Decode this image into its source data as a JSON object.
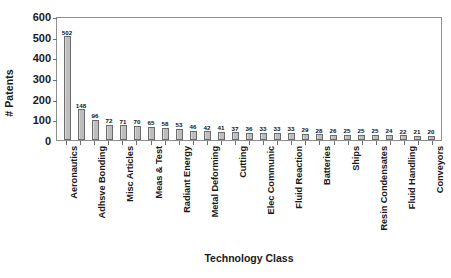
{
  "chart_data": {
    "type": "bar",
    "title": "",
    "xlabel": "Technology Class",
    "ylabel": "# Patents",
    "ylim": [
      0,
      600
    ],
    "yticks": [
      0,
      100,
      200,
      300,
      400,
      500,
      600
    ],
    "grid": false,
    "legend": null,
    "bar_color": "#c4c4c4",
    "bar_edge_color": "#6b6b6b",
    "axis_color": "#8f8f8f",
    "categories": [
      "Aeronautics",
      "",
      "Adhsve Bonding",
      "",
      "Misc Articles",
      "",
      "Meas & Test",
      "",
      "Radiant Energy",
      "",
      "Metal Deforming",
      "",
      "Cutting",
      "",
      "Elec Communic",
      "",
      "Fluid Reaction",
      "",
      "Batteries",
      "",
      "Ships",
      "",
      "Resin Condensates",
      "",
      "Fluid Handling",
      "",
      "Conveyors"
    ],
    "values": [
      502,
      148,
      96,
      72,
      71,
      70,
      65,
      58,
      53,
      46,
      42,
      41,
      37,
      36,
      33,
      33,
      33,
      29,
      28,
      26,
      25,
      25,
      25,
      24,
      22,
      21,
      20
    ],
    "value_labels": [
      "502",
      "148",
      "96",
      "72",
      "71",
      "70",
      "65",
      "58",
      "53",
      "46",
      "42",
      "41",
      "37",
      "36",
      "33",
      "33",
      "33",
      "29",
      "28",
      "26",
      "25",
      "25",
      "25",
      "24",
      "22",
      "21",
      "20"
    ]
  }
}
